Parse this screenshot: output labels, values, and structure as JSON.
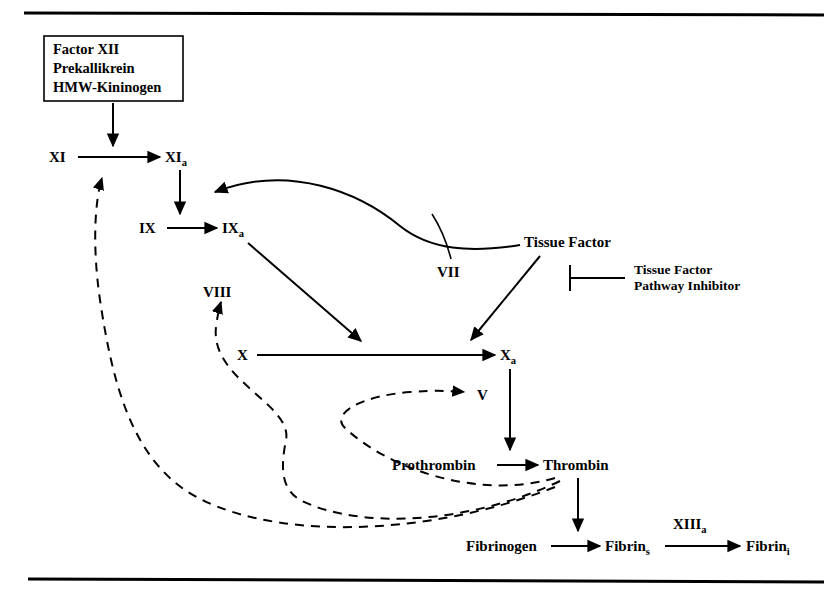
{
  "figure": {
    "background_color": "#ffffff",
    "line_color": "#000000"
  },
  "rules": {
    "top_rule_label": "top-horizontal-rule",
    "bottom_rule_label": "bottom-horizontal-rule"
  },
  "initiation_box": {
    "line1": "Factor XII",
    "line2": "Prekallikrein",
    "line3": "HMW-Kininogen"
  },
  "nodes": {
    "xi": {
      "main": "XI",
      "sub": ""
    },
    "xia": {
      "main": "XI",
      "sub": "a"
    },
    "ix": {
      "main": "IX",
      "sub": ""
    },
    "ixa": {
      "main": "IX",
      "sub": "a"
    },
    "viii": {
      "main": "VIII",
      "sub": ""
    },
    "vii": {
      "main": "VII",
      "sub": ""
    },
    "tissue_factor": {
      "main": "Tissue Factor",
      "sub": ""
    },
    "x": {
      "main": "X",
      "sub": ""
    },
    "xa": {
      "main": "X",
      "sub": "a"
    },
    "v": {
      "main": "V",
      "sub": ""
    },
    "prothrombin": {
      "main": "Prothrombin",
      "sub": ""
    },
    "thrombin": {
      "main": "Thrombin",
      "sub": ""
    },
    "fibrinogen": {
      "main": "Fibrinogen",
      "sub": ""
    },
    "fibrin_s": {
      "main": "Fibrin",
      "sub": "s"
    },
    "fibrin_i": {
      "main": "Fibrin",
      "sub": "i"
    },
    "xiiia": {
      "main": "XIII",
      "sub": "a"
    }
  },
  "annotation": {
    "tfpi_line1": "Tissue Factor",
    "tfpi_line2": "Pathway Inhibitor",
    "symbol": "inhibition-bar"
  },
  "edges": [
    {
      "name": "box-to-xi-arrow",
      "from": "initiation_box",
      "to": "xi",
      "style": "solid"
    },
    {
      "name": "xi-to-xia-arrow",
      "from": "xi",
      "to": "xia",
      "style": "solid"
    },
    {
      "name": "xia-to-ix-arrow",
      "from": "xia",
      "to": "ix",
      "style": "solid"
    },
    {
      "name": "ix-to-ixa-arrow",
      "from": "ix",
      "to": "ixa",
      "style": "solid"
    },
    {
      "name": "ixa-to-xa-arrow",
      "from": "ixa",
      "to": "xa",
      "style": "solid"
    },
    {
      "name": "tissue-factor-to-ixa-curve",
      "from": "tissue_factor",
      "to": "ixa",
      "style": "curved-solid"
    },
    {
      "name": "vii-to-curve-connector",
      "from": "vii",
      "to": "tissue_factor",
      "style": "curved-solid"
    },
    {
      "name": "tissue-factor-to-xa-arrow",
      "from": "tissue_factor",
      "to": "xa",
      "style": "solid"
    },
    {
      "name": "x-to-xa-arrow",
      "from": "x",
      "to": "xa",
      "style": "solid"
    },
    {
      "name": "xa-to-thrombin-arrow",
      "from": "xa",
      "to": "thrombin",
      "style": "solid"
    },
    {
      "name": "prothrombin-to-thrombin-arrow",
      "from": "prothrombin",
      "to": "thrombin",
      "style": "solid"
    },
    {
      "name": "thrombin-to-fibrin-s-arrow",
      "from": "thrombin",
      "to": "fibrin_s",
      "style": "solid"
    },
    {
      "name": "fibrinogen-to-fibrin-s-arrow",
      "from": "fibrinogen",
      "to": "fibrin_s",
      "style": "solid"
    },
    {
      "name": "fibrin-s-to-fibrin-i-arrow",
      "from": "fibrin_s",
      "to": "fibrin_i",
      "style": "solid"
    },
    {
      "name": "thrombin-feedback-to-xi-dashed",
      "from": "thrombin",
      "to": "xi",
      "style": "dashed"
    },
    {
      "name": "thrombin-feedback-to-viii-dashed",
      "from": "thrombin",
      "to": "viii",
      "style": "dashed"
    },
    {
      "name": "thrombin-feedback-to-v-dashed",
      "from": "thrombin",
      "to": "v",
      "style": "dashed"
    }
  ]
}
